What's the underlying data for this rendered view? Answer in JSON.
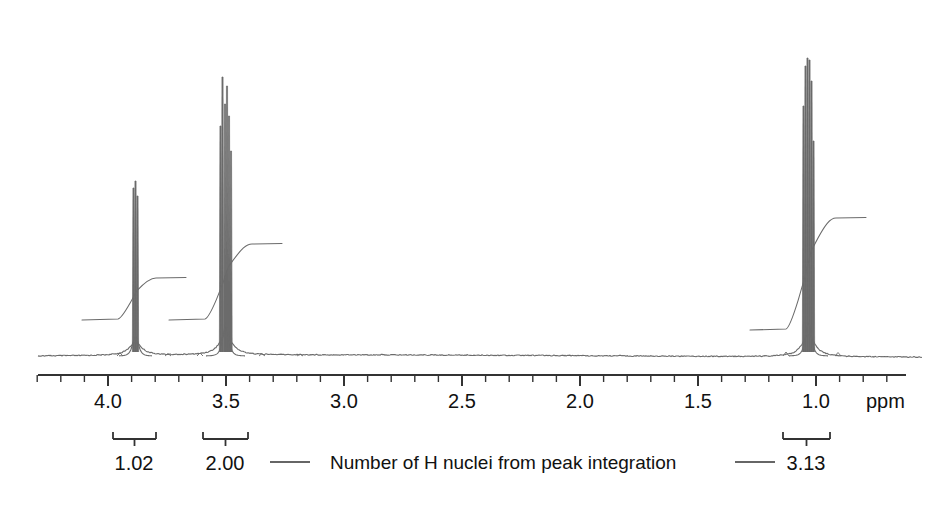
{
  "figure": {
    "kind": "nmr-spectrum",
    "width": 938,
    "height": 505,
    "background": "#ffffff",
    "trace_color": "#6b6b6b",
    "axis_color": "#333333",
    "text_color": "#111111"
  },
  "axis": {
    "label": "ppm",
    "unit": "ppm",
    "direction": "decreasing-left-to-right",
    "line_x_start": 38,
    "line_x_end": 906,
    "line_y": 375,
    "px_per_ppm": 236,
    "ppm_at_x108": 4.0,
    "major_ticks": [
      {
        "value": 4.0,
        "label": "4.0",
        "x": 108
      },
      {
        "value": 3.5,
        "label": "3.5",
        "x": 226
      },
      {
        "value": 3.0,
        "label": "3.0",
        "x": 344
      },
      {
        "value": 2.5,
        "label": "2.5",
        "x": 462
      },
      {
        "value": 2.0,
        "label": "2.0",
        "x": 580
      },
      {
        "value": 1.5,
        "label": "1.5",
        "x": 698
      },
      {
        "value": 1.0,
        "label": "1.0",
        "x": 816
      }
    ],
    "minor_tick_spacing_px": 23.6,
    "minor_tick_spacing_ppm": 0.1,
    "tick_label_y": 390
  },
  "chart_data": {
    "type": "line",
    "title": "",
    "xlabel": "ppm",
    "ylabel": "",
    "xlim": [
      4.35,
      0.72
    ],
    "grid": false,
    "legend": "none",
    "baseline_y_px": 356,
    "peaks": [
      {
        "name": "peak-a",
        "center_ppm": 3.86,
        "label": "1.02",
        "integration": 1.02,
        "multiplicity": "multiplet",
        "apex_y_px": 181,
        "height_px": 175,
        "lines_px": [
          133.5,
          135.5,
          137.5
        ],
        "line_heights_px": [
          168,
          175,
          160
        ]
      },
      {
        "name": "peak-b",
        "center_ppm": 3.52,
        "label": "2.00",
        "integration": 2.0,
        "multiplicity": "multiplet",
        "apex_y_px": 77,
        "height_px": 279,
        "lines_px": [
          220.5,
          222.5,
          225.0,
          227.0,
          229.0,
          231.0
        ],
        "line_heights_px": [
          230,
          279,
          252,
          270,
          240,
          205
        ]
      },
      {
        "name": "peak-c",
        "center_ppm": 1.08,
        "label": "3.13",
        "integration": 3.13,
        "multiplicity": "multiplet",
        "apex_y_px": 58,
        "height_px": 298,
        "lines_px": [
          803.5,
          805.5,
          807.5,
          809.5,
          811.5,
          813.5
        ],
        "line_heights_px": [
          250,
          290,
          298,
          296,
          275,
          215
        ]
      }
    ],
    "integration_steps": [
      {
        "for": "peak-a",
        "rise_px": 42,
        "x_start": 118,
        "x_end": 152,
        "base_y_px": 320
      },
      {
        "for": "peak-b",
        "rise_px": 76,
        "x_start": 205,
        "x_end": 248,
        "base_y_px": 320
      },
      {
        "for": "peak-c",
        "rise_px": 112,
        "x_start": 786,
        "x_end": 832,
        "base_y_px": 330
      }
    ]
  },
  "integration_brackets": [
    {
      "name": "bracket-a",
      "x_left": 113,
      "x_right": 156,
      "y": 432,
      "value_label": "1.02",
      "value_x": 134,
      "value_y": 452
    },
    {
      "name": "bracket-b",
      "x_left": 203,
      "x_right": 248,
      "y": 432,
      "value_label": "2.00",
      "value_x": 225,
      "value_y": 452
    },
    {
      "name": "bracket-c",
      "x_left": 783,
      "x_right": 830,
      "y": 432,
      "value_label": "3.13",
      "value_x": 806,
      "value_y": 452
    }
  ],
  "caption": {
    "text": "Number of H nuclei from peak integration",
    "x": 330,
    "y": 452,
    "leader_left": {
      "x1": 270,
      "x2": 310,
      "y": 462
    },
    "leader_right": {
      "x1": 735,
      "x2": 775,
      "y": 462
    }
  }
}
